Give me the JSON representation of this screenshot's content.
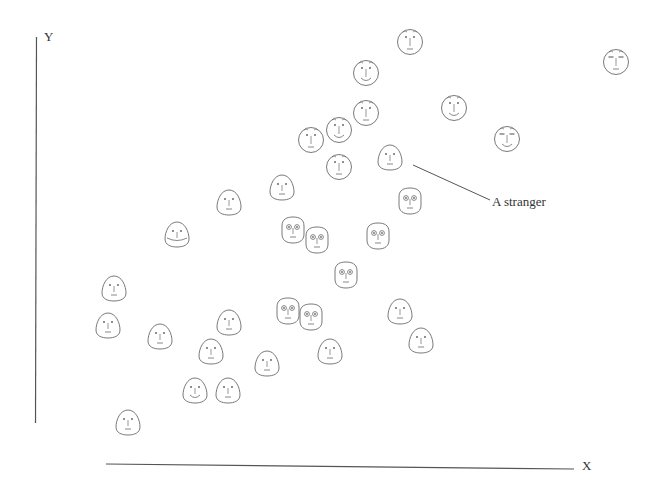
{
  "axes": {
    "x_label": "X",
    "y_label": "Y"
  },
  "annotation": {
    "label": "A stranger",
    "target_face_index": 9
  },
  "colors": {
    "stroke": "#6a6a6a",
    "axis": "#555555",
    "background": "#ffffff"
  },
  "chart_data": {
    "type": "scatter",
    "title": "",
    "xlabel": "X",
    "ylabel": "Y",
    "grid": false,
    "marker": "face",
    "points": [
      {
        "x": 410,
        "y": 42,
        "shape": "round",
        "eyes": "dot",
        "mouth": "flat",
        "brows": true
      },
      {
        "x": 616,
        "y": 62,
        "shape": "round",
        "eyes": "slit",
        "mouth": "flat",
        "brows": true
      },
      {
        "x": 366,
        "y": 73,
        "shape": "round",
        "eyes": "dot",
        "mouth": "smile",
        "brows": true
      },
      {
        "x": 454,
        "y": 108,
        "shape": "round",
        "eyes": "dot",
        "mouth": "smile",
        "brows": true
      },
      {
        "x": 366,
        "y": 113,
        "shape": "round",
        "eyes": "dot",
        "mouth": "flat",
        "brows": true
      },
      {
        "x": 339,
        "y": 130,
        "shape": "round",
        "eyes": "dot",
        "mouth": "smile",
        "brows": true
      },
      {
        "x": 311,
        "y": 140,
        "shape": "round",
        "eyes": "dot",
        "mouth": "flat",
        "brows": true
      },
      {
        "x": 507,
        "y": 139,
        "shape": "round",
        "eyes": "slit",
        "mouth": "smile",
        "brows": true
      },
      {
        "x": 339,
        "y": 167,
        "shape": "round",
        "eyes": "dot",
        "mouth": "flat",
        "brows": true
      },
      {
        "x": 390,
        "y": 157,
        "shape": "egg",
        "eyes": "dot",
        "mouth": "flat",
        "brows": false
      },
      {
        "x": 282,
        "y": 187,
        "shape": "egg",
        "eyes": "dot",
        "mouth": "flat",
        "brows": false
      },
      {
        "x": 229,
        "y": 202,
        "shape": "egg",
        "eyes": "dot",
        "mouth": "flat",
        "brows": false
      },
      {
        "x": 410,
        "y": 201,
        "shape": "square",
        "eyes": "bug",
        "mouth": "flat",
        "brows": false
      },
      {
        "x": 177,
        "y": 234,
        "shape": "egg",
        "eyes": "dot",
        "mouth": "wide",
        "brows": false
      },
      {
        "x": 293,
        "y": 230,
        "shape": "square",
        "eyes": "bug",
        "mouth": "flat",
        "brows": false
      },
      {
        "x": 317,
        "y": 240,
        "shape": "square",
        "eyes": "bug",
        "mouth": "flat",
        "brows": false
      },
      {
        "x": 378,
        "y": 236,
        "shape": "square",
        "eyes": "bug",
        "mouth": "flat",
        "brows": false
      },
      {
        "x": 346,
        "y": 275,
        "shape": "square",
        "eyes": "bug",
        "mouth": "flat",
        "brows": false
      },
      {
        "x": 114,
        "y": 288,
        "shape": "egg",
        "eyes": "dot",
        "mouth": "flat",
        "brows": false
      },
      {
        "x": 108,
        "y": 325,
        "shape": "egg",
        "eyes": "dot",
        "mouth": "flat",
        "brows": false
      },
      {
        "x": 160,
        "y": 336,
        "shape": "egg",
        "eyes": "dot",
        "mouth": "flat",
        "brows": false
      },
      {
        "x": 229,
        "y": 322,
        "shape": "egg",
        "eyes": "dot",
        "mouth": "flat",
        "brows": false
      },
      {
        "x": 288,
        "y": 311,
        "shape": "square",
        "eyes": "bug",
        "mouth": "flat",
        "brows": false
      },
      {
        "x": 311,
        "y": 317,
        "shape": "square",
        "eyes": "bug",
        "mouth": "flat",
        "brows": false
      },
      {
        "x": 400,
        "y": 311,
        "shape": "egg",
        "eyes": "dot",
        "mouth": "flat",
        "brows": false
      },
      {
        "x": 421,
        "y": 340,
        "shape": "egg",
        "eyes": "dot",
        "mouth": "flat",
        "brows": false
      },
      {
        "x": 211,
        "y": 351,
        "shape": "egg",
        "eyes": "dot",
        "mouth": "flat",
        "brows": false
      },
      {
        "x": 267,
        "y": 363,
        "shape": "egg",
        "eyes": "dot",
        "mouth": "flat",
        "brows": false
      },
      {
        "x": 330,
        "y": 351,
        "shape": "egg",
        "eyes": "dot",
        "mouth": "flat",
        "brows": false
      },
      {
        "x": 195,
        "y": 390,
        "shape": "egg",
        "eyes": "dot",
        "mouth": "smile",
        "brows": false
      },
      {
        "x": 228,
        "y": 390,
        "shape": "egg",
        "eyes": "dot",
        "mouth": "flat",
        "brows": false
      },
      {
        "x": 128,
        "y": 422,
        "shape": "egg",
        "eyes": "dot",
        "mouth": "flat",
        "brows": false
      }
    ],
    "annotations": [
      {
        "text": "A stranger",
        "from": [
          413,
          165
        ],
        "to": [
          490,
          200
        ]
      }
    ]
  }
}
